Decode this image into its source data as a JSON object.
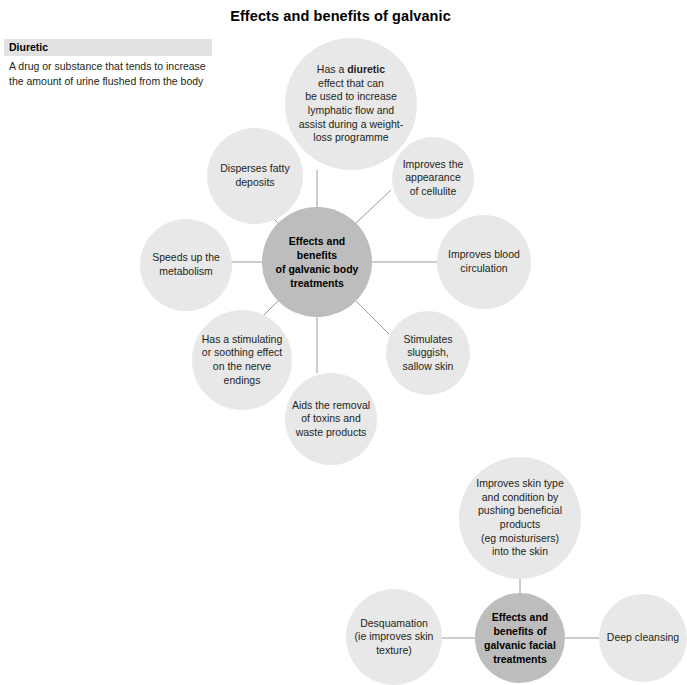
{
  "title": "Effects and benefits of galvanic",
  "glossary": {
    "term": "Diuretic",
    "definition": "A drug or substance that tends to increase the amount of urine flushed from the body"
  },
  "colors": {
    "hub_fill": "#bdbdbd",
    "satellite_fill": "#e8e8e8",
    "connector": "#9a9a9a",
    "text": "#231f20",
    "glossary_term_band": "#e2e2e2"
  },
  "body_diagram": {
    "hub": {
      "label": "Effects and benefits\nof galvanic body\ntreatments"
    },
    "satellites": [
      {
        "id": "diuretic",
        "label_html": "Has a <b>diuretic</b>\neffect that can\nbe used to increase\nlymphatic flow and\nassist during a weight-\nloss programme"
      },
      {
        "id": "cellulite",
        "label": "Improves the\nappearance\nof cellulite"
      },
      {
        "id": "circulation",
        "label": "Improves blood\ncirculation"
      },
      {
        "id": "sallow-skin",
        "label": "Stimulates\nsluggish,\nsallow skin"
      },
      {
        "id": "toxins",
        "label": "Aids the removal\nof toxins and\nwaste products"
      },
      {
        "id": "nerve",
        "label": "Has a stimulating\nor soothing effect\non the nerve\nendings"
      },
      {
        "id": "metabolism",
        "label": "Speeds up the\nmetabolism"
      },
      {
        "id": "fatty",
        "label": "Disperses fatty\ndeposits"
      }
    ]
  },
  "facial_diagram": {
    "hub": {
      "label": "Effects and\nbenefits of\ngalvanic facial\ntreatments"
    },
    "satellites": [
      {
        "id": "skin-type",
        "label": "Improves skin type\nand condition by\npushing beneficial\nproducts\n(eg moisturisers)\ninto the skin"
      },
      {
        "id": "desquamation",
        "label": "Desquamation\n(ie improves skin\ntexture)"
      },
      {
        "id": "deep-cleansing",
        "label": "Deep cleansing"
      }
    ]
  }
}
